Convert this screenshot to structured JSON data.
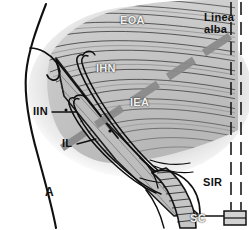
{
  "figure": {
    "panel_label": "A",
    "width": 249,
    "height": 230
  },
  "labels": {
    "eoa": "EOA",
    "linea_alba_line1": "Linea",
    "linea_alba_line2": "alba",
    "ihn": "IHN",
    "iea": "IEA",
    "iin": "IIN",
    "il": "IL",
    "sir": "SIR",
    "sc": "SC"
  },
  "colors": {
    "ink": "#111111",
    "aponeurosis_fill": "#c9c9c9",
    "aponeurosis_fiber": "#4a4a4a",
    "incision_band": "#8e8e8e",
    "shadow_halo": "#b5b5b5",
    "label_light": "#f2f2f2",
    "background": "#ffffff"
  }
}
